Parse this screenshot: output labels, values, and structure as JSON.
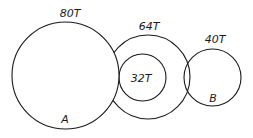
{
  "diagram": {
    "type": "gear-train",
    "gears": [
      {
        "id": "A",
        "label": "A",
        "teeth_label": "80T",
        "cx": 65.5,
        "cy": 75.5,
        "r": 53.5
      },
      {
        "id": "compound_outer",
        "label": "",
        "teeth_label": "64T",
        "cx": 148,
        "cy": 77,
        "r": 42
      },
      {
        "id": "compound_inner",
        "label": "",
        "teeth_label": "32T",
        "cx": 142.5,
        "cy": 77.5,
        "r": 23.5
      },
      {
        "id": "B",
        "label": "B",
        "teeth_label": "40T",
        "cx": 212.5,
        "cy": 77.5,
        "r": 28.5
      }
    ],
    "labels": {
      "gear_a_teeth": "80T",
      "gear_a_name": "A",
      "compound_outer_teeth": "64T",
      "compound_inner_teeth": "32T",
      "gear_b_teeth": "40T",
      "gear_b_name": "B"
    },
    "stroke_color": "#1a1a1a",
    "background": "#ffffff"
  }
}
